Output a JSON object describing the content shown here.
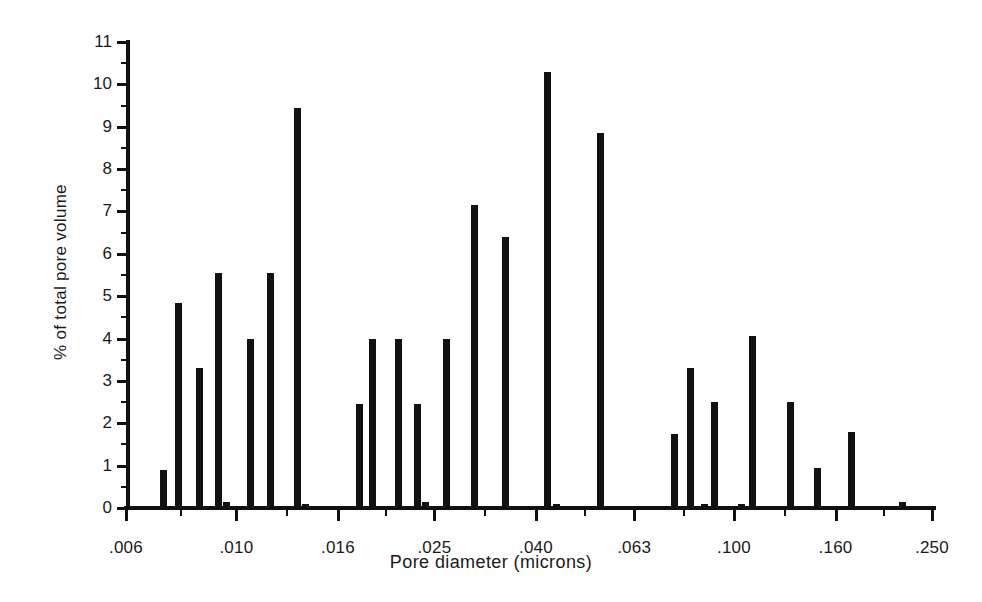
{
  "chart_data": {
    "type": "bar",
    "title": "",
    "xlabel": "Pore diameter (microns)",
    "ylabel": "% of total pore volume",
    "xscale": "log",
    "xlim": [
      0.006,
      0.25
    ],
    "ylim": [
      0,
      11
    ],
    "grid": false,
    "legend": null,
    "xtick_labels": [
      ".006",
      ".010",
      ".016",
      ".025",
      ".040",
      ".063",
      ".100",
      ".160",
      ".250"
    ],
    "xtick_values": [
      0.006,
      0.01,
      0.016,
      0.025,
      0.04,
      0.063,
      0.1,
      0.16,
      0.25
    ],
    "ytick_labels": [
      "0",
      "1",
      "2",
      "3",
      "4",
      "5",
      "6",
      "7",
      "8",
      "9",
      "10",
      "11"
    ],
    "ytick_values": [
      0,
      1,
      2,
      3,
      4,
      5,
      6,
      7,
      8,
      9,
      10,
      11
    ],
    "ytick_minor_step": 0.5,
    "bar_color": "#111111",
    "x": [
      0.0071,
      0.0079,
      0.00905,
      0.0101,
      0.0103,
      0.0118,
      0.0132,
      0.0156,
      0.0157,
      0.0199,
      0.0209,
      0.0238,
      0.0265,
      0.0267,
      0.0305,
      0.0345,
      0.0395,
      0.0431,
      0.0435,
      0.054,
      0.0605,
      0.07,
      0.076,
      0.082,
      0.085,
      0.097,
      0.104,
      0.115,
      0.126,
      0.145,
      0.165,
      0.21
    ],
    "values": [
      0.9,
      4.85,
      3.3,
      5.55,
      0.15,
      3.98,
      5.55,
      9.45,
      0.1,
      2.45,
      3.98,
      3.98,
      2.45,
      0.15,
      3.98,
      7.15,
      6.4,
      10.3,
      0.1,
      8.85,
      0.05,
      1.75,
      3.3,
      0.1,
      2.5,
      0.1,
      4.05,
      0.05,
      2.5,
      0.95,
      1.8,
      0.15
    ],
    "categories": null,
    "series": [
      {
        "name": "Pore volume distribution",
        "values": [
          0.9,
          4.85,
          3.3,
          5.55,
          0.15,
          3.98,
          5.55,
          9.45,
          0.1,
          2.45,
          3.98,
          3.98,
          2.45,
          0.15,
          3.98,
          7.15,
          6.4,
          10.3,
          0.1,
          8.85,
          0.05,
          1.75,
          3.3,
          0.1,
          2.5,
          0.1,
          4.05,
          0.05,
          2.5,
          0.95,
          1.8,
          0.15
        ]
      }
    ],
    "bar_pixel_centers": [
      163,
      178,
      199,
      218,
      226,
      250,
      270,
      297,
      305,
      359,
      372,
      398,
      417,
      425,
      446,
      474,
      505,
      547,
      556,
      600,
      648,
      674,
      690,
      704,
      714,
      741,
      752,
      772,
      790,
      817,
      851,
      902
    ]
  },
  "figure": {
    "background_color": "#ffffff",
    "axis_color": "#111111",
    "text_color": "#1a1a1a"
  }
}
